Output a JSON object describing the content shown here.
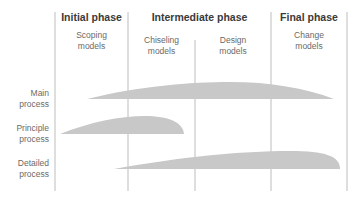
{
  "phases": [
    {
      "title": "Initial phase"
    },
    {
      "title": "Intermediate phase"
    },
    {
      "title": "Final phase"
    }
  ],
  "models": [
    {
      "line1": "Scoping",
      "line2": "models"
    },
    {
      "line1": "Chiseling",
      "line2": "models"
    },
    {
      "line1": "Design",
      "line2": "models"
    },
    {
      "line1": "Change",
      "line2": "models"
    }
  ],
  "processes": [
    {
      "line1": "Main",
      "line2": "process"
    },
    {
      "line1": "Principle",
      "line2": "process"
    },
    {
      "line1": "Detailed",
      "line2": "process"
    }
  ],
  "colors": {
    "shape_fill": "#c8c8c8",
    "divider": "#bdbdbd"
  }
}
